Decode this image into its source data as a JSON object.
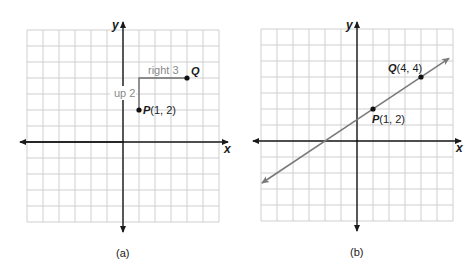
{
  "panels": [
    {
      "id": "a",
      "caption": "(a)",
      "x_axis_label": "x",
      "y_axis_label": "y",
      "grid": {
        "x_min": -6,
        "x_max": 6,
        "y_min": -5,
        "y_max": 7
      },
      "points": [
        {
          "name": "P",
          "label": "P",
          "coords": "(1, 2)",
          "x": 1,
          "y": 2
        },
        {
          "name": "Q",
          "label": "Q",
          "coords": "",
          "x": 4,
          "y": 4
        }
      ],
      "annotations": {
        "up": "up 2",
        "right": "right 3"
      }
    },
    {
      "id": "b",
      "caption": "(b)",
      "x_axis_label": "x",
      "y_axis_label": "y",
      "grid": {
        "x_min": -6,
        "x_max": 6,
        "y_min": -5,
        "y_max": 7
      },
      "points": [
        {
          "name": "P",
          "label": "P",
          "coords": "(1, 2)",
          "x": 1,
          "y": 2
        },
        {
          "name": "Q",
          "label": "Q",
          "coords": "(4, 4)",
          "x": 4,
          "y": 4
        }
      ],
      "line": {
        "slope": "2/3",
        "intercept": "4/3",
        "x_intercept": -2
      }
    }
  ],
  "colors": {
    "axis": "#1a1a1a",
    "grid": "#c9c9c9",
    "annotation": "#8a8a8a",
    "line": "#7a7a7a"
  }
}
